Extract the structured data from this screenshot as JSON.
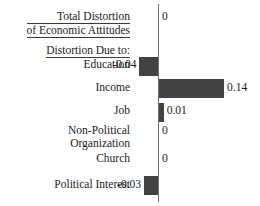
{
  "chart_data": {
    "type": "bar",
    "orientation": "horizontal",
    "title_lines": [
      "Total Distortion",
      "of Economic Attitudes"
    ],
    "group_header": "Distortion Due to:",
    "xlabel": "",
    "ylabel": "",
    "grid": false,
    "legend": false,
    "zero_axis": true,
    "xlim": [
      -0.06,
      0.16
    ],
    "categories": [
      "Total Distortion of Economic Attitudes",
      "Education",
      "Income",
      "Job",
      "Non-Political Organization",
      "Church",
      "Political Interest"
    ],
    "values": [
      0,
      -0.04,
      0.14,
      0.01,
      0,
      0,
      -0.03
    ],
    "value_labels": [
      "0",
      "-0.04",
      "0.14",
      "0.01",
      "0",
      "0",
      "-0.03"
    ],
    "bar_color": "#424242",
    "axis_color": "#6e6e6e"
  },
  "rows": [
    {
      "id": "total-distortion",
      "label_lines": [
        "Total Distortion",
        "of Economic Attitudes"
      ],
      "value": 0,
      "value_label": "0",
      "underlined": true,
      "is_header": true
    },
    {
      "id": "group-header",
      "label_lines": [
        "Distortion Due to:"
      ],
      "value": null,
      "value_label": "",
      "underlined": true,
      "is_header": true
    },
    {
      "id": "education",
      "label_lines": [
        "Education"
      ],
      "value": -0.04,
      "value_label": "-0.04",
      "underlined": false,
      "is_header": false
    },
    {
      "id": "income",
      "label_lines": [
        "Income"
      ],
      "value": 0.14,
      "value_label": "0.14",
      "underlined": false,
      "is_header": false
    },
    {
      "id": "job",
      "label_lines": [
        "Job"
      ],
      "value": 0.01,
      "value_label": "0.01",
      "underlined": false,
      "is_header": false
    },
    {
      "id": "non-political-organization",
      "label_lines": [
        "Non-Political",
        "Organization"
      ],
      "value": 0,
      "value_label": "0",
      "underlined": false,
      "is_header": false
    },
    {
      "id": "church",
      "label_lines": [
        "Church"
      ],
      "value": 0,
      "value_label": "0",
      "underlined": false,
      "is_header": false
    },
    {
      "id": "political-interest",
      "label_lines": [
        "Political Interest"
      ],
      "value": -0.03,
      "value_label": "-0.03",
      "underlined": false,
      "is_header": false
    }
  ],
  "layout": {
    "axis_x": 158,
    "px_per_unit": 465,
    "bar_height": 19,
    "row_y": {
      "total-distortion": 11,
      "group-header": 44,
      "education": 57,
      "income": 79,
      "job": 103,
      "non-political-organization": 124,
      "church": 152,
      "political-interest": 176
    },
    "label_y": {
      "total-distortion": 10,
      "group-header": 44,
      "education": 58,
      "income": 81,
      "job": 104,
      "non-political-organization": 124,
      "church": 152,
      "political-interest": 178
    }
  }
}
